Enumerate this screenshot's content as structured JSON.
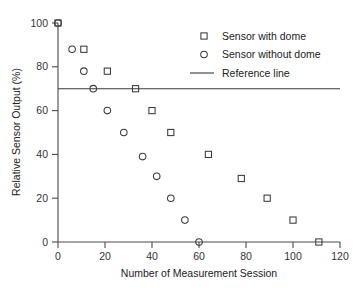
{
  "chart_data": {
    "type": "scatter",
    "title": "",
    "xlabel": "Number of Measurement Session",
    "ylabel": "Relative Sensor Output (%)",
    "xlim": [
      0,
      120
    ],
    "ylim": [
      0,
      100
    ],
    "xticks": [
      0,
      20,
      40,
      60,
      80,
      100,
      120
    ],
    "yticks": [
      0,
      20,
      40,
      60,
      80,
      100
    ],
    "xtick_labels": [
      "0",
      "20",
      "40",
      "60",
      "80",
      "100",
      "120"
    ],
    "ytick_labels": [
      "0",
      "20",
      "40",
      "60",
      "80",
      "100"
    ],
    "grid": false,
    "legend_position": "top-right",
    "series": [
      {
        "name": "Sensor with dome",
        "marker": "square",
        "color": "#3a3a3a",
        "points": [
          {
            "x": 0,
            "y": 100
          },
          {
            "x": 11,
            "y": 88
          },
          {
            "x": 21,
            "y": 78
          },
          {
            "x": 33,
            "y": 70
          },
          {
            "x": 40,
            "y": 60
          },
          {
            "x": 48,
            "y": 50
          },
          {
            "x": 64,
            "y": 40
          },
          {
            "x": 78,
            "y": 29
          },
          {
            "x": 89,
            "y": 20
          },
          {
            "x": 100,
            "y": 10
          },
          {
            "x": 111,
            "y": 0
          }
        ]
      },
      {
        "name": "Sensor without dome",
        "marker": "circle",
        "color": "#3a3a3a",
        "points": [
          {
            "x": 0,
            "y": 100
          },
          {
            "x": 6,
            "y": 88
          },
          {
            "x": 11,
            "y": 78
          },
          {
            "x": 15,
            "y": 70
          },
          {
            "x": 21,
            "y": 60
          },
          {
            "x": 28,
            "y": 50
          },
          {
            "x": 36,
            "y": 39
          },
          {
            "x": 42,
            "y": 30
          },
          {
            "x": 48,
            "y": 20
          },
          {
            "x": 54,
            "y": 10
          },
          {
            "x": 60,
            "y": 0
          }
        ]
      }
    ],
    "reference_line": {
      "name": "Reference line",
      "y": 70,
      "color": "#3a3a3a"
    }
  },
  "legend": {
    "items": [
      {
        "label": "Sensor with dome",
        "marker": "square"
      },
      {
        "label": "Sensor without dome",
        "marker": "circle"
      },
      {
        "label": "Reference line",
        "marker": "line"
      }
    ]
  },
  "axes": {
    "x_title": "Number of Measurement Session",
    "y_title": "Relative Sensor Output (%)"
  }
}
